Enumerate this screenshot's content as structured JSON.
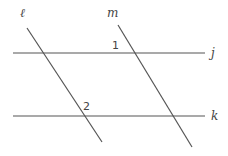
{
  "diagram": {
    "type": "parallel-lines-with-transversals",
    "lines": {
      "j": {
        "label": "j",
        "kind": "horizontal"
      },
      "k": {
        "label": "k",
        "kind": "horizontal"
      },
      "l": {
        "label": "ℓ",
        "kind": "transversal"
      },
      "m": {
        "label": "m",
        "kind": "transversal"
      }
    },
    "angles": [
      {
        "label": "1",
        "at": "intersection of m and j"
      },
      {
        "label": "2",
        "at": "intersection of ℓ and k"
      }
    ],
    "colors": {
      "line": "#555555",
      "text": "#444444",
      "background": "#ffffff"
    }
  }
}
